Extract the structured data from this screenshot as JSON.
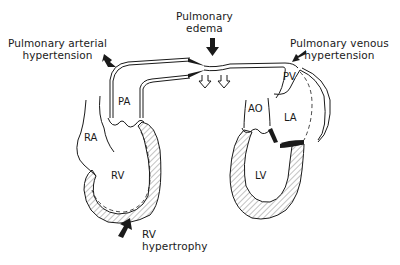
{
  "diagram": {
    "annotations": [
      {
        "id": "pa_hypertension",
        "line1": "Pulmonary arterial",
        "line2": "hypertension"
      },
      {
        "id": "pulmonary_edema",
        "line1": "Pulmonary",
        "line2": "edema"
      },
      {
        "id": "pv_hypertension",
        "line1": "Pulmonary venous",
        "line2": "hypertension"
      },
      {
        "id": "rv_hypertrophy",
        "line1": "RV",
        "line2": "hypertrophy"
      }
    ],
    "chambers": {
      "pa": "PA",
      "ra": "RA",
      "rv": "RV",
      "ao": "AO",
      "la": "LA",
      "lv": "LV",
      "pv": "PV"
    },
    "colors": {
      "stroke": "#1a1a1a",
      "background": "#ffffff",
      "hatch": "#555555"
    }
  }
}
